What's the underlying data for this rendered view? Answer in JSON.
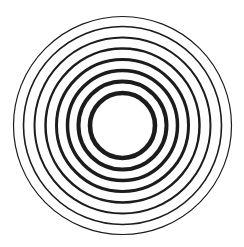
{
  "image": {
    "description": "concentric circles",
    "background": "#ffffff",
    "stroke_color": "#1c1c1c",
    "center": {
      "x": 122.5,
      "y": 125.5
    },
    "rings": [
      {
        "r": 109,
        "stroke_width": 1.2
      },
      {
        "r": 99,
        "stroke_width": 1.6
      },
      {
        "r": 88,
        "stroke_width": 2.0
      },
      {
        "r": 77,
        "stroke_width": 2.5
      },
      {
        "r": 66,
        "stroke_width": 3.0
      },
      {
        "r": 55,
        "stroke_width": 3.5
      },
      {
        "r": 44,
        "stroke_width": 4.0
      },
      {
        "r": 32.5,
        "stroke_width": 4.6
      }
    ]
  }
}
